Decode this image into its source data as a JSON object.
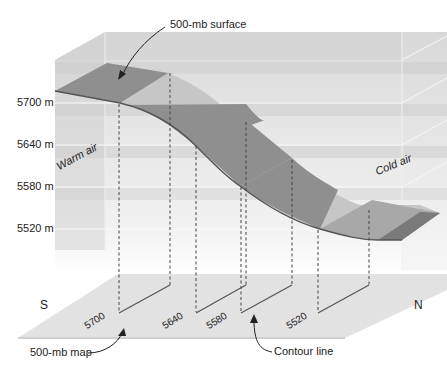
{
  "title_callouts": {
    "surface": "500-mb surface",
    "map": "500-mb map",
    "contour": "Contour line"
  },
  "air_masses": {
    "warm": "Warm air",
    "cold": "Cold air"
  },
  "directions": {
    "south": "S",
    "north": "N"
  },
  "altitude_labels": [
    "5700 m",
    "5640 m",
    "5580 m",
    "5520 m"
  ],
  "contour_labels": [
    "5700",
    "5640",
    "5580",
    "5520"
  ],
  "colors": {
    "surface_dark": "#8f8f8f",
    "surface_light": "#c4c4c4",
    "box_band": "#dcdcdc",
    "ground": "#e0e0e0",
    "line": "#555555"
  }
}
